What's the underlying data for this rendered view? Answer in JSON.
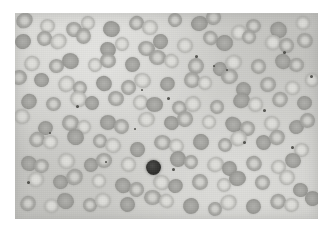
{
  "figure": {
    "kind": "photomicrograph",
    "modality": "light microscopy, Romanowsky-type stain rendered in grayscale",
    "canvas": {
      "width": 334,
      "height": 232,
      "page_background": "#ffffff"
    },
    "plate": {
      "left": 15,
      "top": 13,
      "width": 303,
      "height": 206,
      "background_color": "#d2d2ce",
      "border": "none"
    },
    "palette": {
      "page_white": "#ffffff",
      "field_light": "#d7d7d3",
      "field_mid": "#cdcdc9",
      "rbc_membrane": "#9e9e9a",
      "rbc_pallor": "#d6d6d2",
      "dark_cell": "#2e2e2c",
      "platelet": "#46464200"
    },
    "caption": "",
    "labels": [],
    "scale_bar": null,
    "annotations": []
  },
  "objects": {
    "dark_cell": {
      "name": "large dark nucleated cell",
      "cx": 131,
      "cy": 147,
      "d": 15
    },
    "erythrocytes": [
      {
        "x": 6,
        "y": 4,
        "w": 17,
        "h": 15,
        "k": ""
      },
      {
        "x": 26,
        "y": 2,
        "w": 15,
        "h": 14,
        "k": "pale"
      },
      {
        "x": 48,
        "y": 6,
        "w": 16,
        "h": 15,
        "k": ""
      },
      {
        "x": 70,
        "y": 1,
        "w": 14,
        "h": 14,
        "k": "pale"
      },
      {
        "x": 88,
        "y": 7,
        "w": 17,
        "h": 16,
        "k": "dense"
      },
      {
        "x": 110,
        "y": 3,
        "w": 15,
        "h": 14,
        "k": ""
      },
      {
        "x": 130,
        "y": 8,
        "w": 16,
        "h": 15,
        "k": "pale"
      },
      {
        "x": 152,
        "y": 2,
        "w": 14,
        "h": 14,
        "k": ""
      },
      {
        "x": 171,
        "y": 6,
        "w": 17,
        "h": 15,
        "k": "dense"
      },
      {
        "x": 193,
        "y": 1,
        "w": 15,
        "h": 15,
        "k": ""
      },
      {
        "x": 214,
        "y": 8,
        "w": 16,
        "h": 15,
        "k": "pale"
      },
      {
        "x": 236,
        "y": 3,
        "w": 15,
        "h": 14,
        "k": ""
      },
      {
        "x": 256,
        "y": 7,
        "w": 17,
        "h": 16,
        "k": "dense"
      },
      {
        "x": 278,
        "y": 2,
        "w": 14,
        "h": 14,
        "k": "pale"
      },
      {
        "x": 286,
        "y": 20,
        "w": 16,
        "h": 15,
        "k": ""
      },
      {
        "x": 0,
        "y": 22,
        "w": 16,
        "h": 15,
        "k": "dense"
      },
      {
        "x": 18,
        "y": 20,
        "w": 15,
        "h": 15,
        "k": ""
      },
      {
        "x": 38,
        "y": 24,
        "w": 17,
        "h": 15,
        "k": "pale"
      },
      {
        "x": 60,
        "y": 19,
        "w": 15,
        "h": 16,
        "k": ""
      },
      {
        "x": 80,
        "y": 25,
        "w": 16,
        "h": 15,
        "k": "dense"
      },
      {
        "x": 102,
        "y": 21,
        "w": 14,
        "h": 14,
        "k": "pale"
      },
      {
        "x": 121,
        "y": 26,
        "w": 17,
        "h": 15,
        "k": ""
      },
      {
        "x": 143,
        "y": 20,
        "w": 15,
        "h": 15,
        "k": "dense"
      },
      {
        "x": 163,
        "y": 25,
        "w": 16,
        "h": 15,
        "k": "pale"
      },
      {
        "x": 185,
        "y": 19,
        "w": 15,
        "h": 14,
        "k": ""
      },
      {
        "x": 205,
        "y": 24,
        "w": 17,
        "h": 16,
        "k": "dense"
      },
      {
        "x": 227,
        "y": 20,
        "w": 14,
        "h": 14,
        "k": ""
      },
      {
        "x": 246,
        "y": 26,
        "w": 16,
        "h": 15,
        "k": "pale"
      },
      {
        "x": 267,
        "y": 21,
        "w": 15,
        "h": 15,
        "k": ""
      },
      {
        "x": 8,
        "y": 40,
        "w": 16,
        "h": 15,
        "k": "pale"
      },
      {
        "x": 29,
        "y": 44,
        "w": 15,
        "h": 14,
        "k": ""
      },
      {
        "x": 49,
        "y": 39,
        "w": 17,
        "h": 16,
        "k": "dense"
      },
      {
        "x": 71,
        "y": 45,
        "w": 14,
        "h": 14,
        "k": "pale"
      },
      {
        "x": 90,
        "y": 41,
        "w": 16,
        "h": 15,
        "k": ""
      },
      {
        "x": 111,
        "y": 46,
        "w": 15,
        "h": 15,
        "k": "dense"
      },
      {
        "x": 131,
        "y": 40,
        "w": 17,
        "h": 15,
        "k": ""
      },
      {
        "x": 153,
        "y": 45,
        "w": 15,
        "h": 14,
        "k": "pale"
      },
      {
        "x": 173,
        "y": 41,
        "w": 16,
        "h": 16,
        "k": ""
      },
      {
        "x": 194,
        "y": 46,
        "w": 14,
        "h": 14,
        "k": "dense"
      },
      {
        "x": 213,
        "y": 40,
        "w": 17,
        "h": 15,
        "k": "pale"
      },
      {
        "x": 235,
        "y": 45,
        "w": 15,
        "h": 15,
        "k": ""
      },
      {
        "x": 255,
        "y": 41,
        "w": 16,
        "h": 15,
        "k": "dense"
      },
      {
        "x": 276,
        "y": 46,
        "w": 15,
        "h": 14,
        "k": ""
      },
      {
        "x": 288,
        "y": 62,
        "w": 14,
        "h": 14,
        "k": "pale"
      },
      {
        "x": 1,
        "y": 60,
        "w": 16,
        "h": 15,
        "k": ""
      },
      {
        "x": 20,
        "y": 64,
        "w": 15,
        "h": 14,
        "k": "dense"
      },
      {
        "x": 40,
        "y": 59,
        "w": 17,
        "h": 16,
        "k": "pale"
      },
      {
        "x": 62,
        "y": 65,
        "w": 14,
        "h": 14,
        "k": ""
      },
      {
        "x": 81,
        "y": 61,
        "w": 16,
        "h": 15,
        "k": "dense"
      },
      {
        "x": 102,
        "y": 66,
        "w": 15,
        "h": 15,
        "k": ""
      },
      {
        "x": 122,
        "y": 60,
        "w": 17,
        "h": 15,
        "k": "pale"
      },
      {
        "x": 144,
        "y": 65,
        "w": 15,
        "h": 14,
        "k": "dense"
      },
      {
        "x": 164,
        "y": 61,
        "w": 16,
        "h": 16,
        "k": ""
      },
      {
        "x": 185,
        "y": 66,
        "w": 14,
        "h": 14,
        "k": "pale"
      },
      {
        "x": 204,
        "y": 60,
        "w": 17,
        "h": 15,
        "k": ""
      },
      {
        "x": 226,
        "y": 65,
        "w": 15,
        "h": 15,
        "k": "dense"
      },
      {
        "x": 246,
        "y": 61,
        "w": 16,
        "h": 15,
        "k": ""
      },
      {
        "x": 267,
        "y": 66,
        "w": 15,
        "h": 14,
        "k": "pale"
      },
      {
        "x": 10,
        "y": 80,
        "w": 16,
        "h": 15,
        "k": "dense"
      },
      {
        "x": 31,
        "y": 84,
        "w": 15,
        "h": 14,
        "k": ""
      },
      {
        "x": 51,
        "y": 79,
        "w": 17,
        "h": 16,
        "k": "pale"
      },
      {
        "x": 73,
        "y": 85,
        "w": 14,
        "h": 14,
        "k": "dense"
      },
      {
        "x": 92,
        "y": 81,
        "w": 16,
        "h": 15,
        "k": ""
      },
      {
        "x": 113,
        "y": 86,
        "w": 15,
        "h": 15,
        "k": "pale"
      },
      {
        "x": 133,
        "y": 80,
        "w": 17,
        "h": 15,
        "k": "dense"
      },
      {
        "x": 155,
        "y": 85,
        "w": 15,
        "h": 14,
        "k": ""
      },
      {
        "x": 175,
        "y": 81,
        "w": 16,
        "h": 16,
        "k": "pale"
      },
      {
        "x": 196,
        "y": 86,
        "w": 14,
        "h": 14,
        "k": ""
      },
      {
        "x": 215,
        "y": 80,
        "w": 17,
        "h": 15,
        "k": "dense"
      },
      {
        "x": 237,
        "y": 85,
        "w": 15,
        "h": 15,
        "k": "pale"
      },
      {
        "x": 257,
        "y": 81,
        "w": 16,
        "h": 15,
        "k": ""
      },
      {
        "x": 278,
        "y": 86,
        "w": 15,
        "h": 14,
        "k": "dense"
      },
      {
        "x": 2,
        "y": 100,
        "w": 16,
        "h": 15,
        "k": "pale"
      },
      {
        "x": 22,
        "y": 104,
        "w": 15,
        "h": 14,
        "k": "dense"
      },
      {
        "x": 42,
        "y": 99,
        "w": 17,
        "h": 16,
        "k": ""
      },
      {
        "x": 64,
        "y": 105,
        "w": 14,
        "h": 14,
        "k": "pale"
      },
      {
        "x": 83,
        "y": 101,
        "w": 16,
        "h": 15,
        "k": "dense"
      },
      {
        "x": 104,
        "y": 106,
        "w": 15,
        "h": 15,
        "k": ""
      },
      {
        "x": 124,
        "y": 100,
        "w": 17,
        "h": 15,
        "k": "pale"
      },
      {
        "x": 146,
        "y": 105,
        "w": 15,
        "h": 14,
        "k": "dense"
      },
      {
        "x": 166,
        "y": 101,
        "w": 16,
        "h": 16,
        "k": ""
      },
      {
        "x": 187,
        "y": 106,
        "w": 14,
        "h": 14,
        "k": "pale"
      },
      {
        "x": 206,
        "y": 100,
        "w": 17,
        "h": 15,
        "k": "dense"
      },
      {
        "x": 228,
        "y": 105,
        "w": 15,
        "h": 15,
        "k": ""
      },
      {
        "x": 248,
        "y": 101,
        "w": 16,
        "h": 15,
        "k": "pale"
      },
      {
        "x": 269,
        "y": 106,
        "w": 15,
        "h": 14,
        "k": "dense"
      },
      {
        "x": 287,
        "y": 100,
        "w": 15,
        "h": 15,
        "k": ""
      },
      {
        "x": 12,
        "y": 120,
        "w": 16,
        "h": 15,
        "k": ""
      },
      {
        "x": 33,
        "y": 124,
        "w": 15,
        "h": 14,
        "k": "pale"
      },
      {
        "x": 53,
        "y": 119,
        "w": 17,
        "h": 16,
        "k": "dense"
      },
      {
        "x": 75,
        "y": 125,
        "w": 14,
        "h": 14,
        "k": ""
      },
      {
        "x": 94,
        "y": 121,
        "w": 16,
        "h": 15,
        "k": "pale"
      },
      {
        "x": 115,
        "y": 126,
        "w": 15,
        "h": 15,
        "k": "dense"
      },
      {
        "x": 135,
        "y": 120,
        "w": 17,
        "h": 15,
        "k": ""
      },
      {
        "x": 157,
        "y": 125,
        "w": 15,
        "h": 14,
        "k": "pale"
      },
      {
        "x": 177,
        "y": 121,
        "w": 16,
        "h": 16,
        "k": "dense"
      },
      {
        "x": 198,
        "y": 126,
        "w": 14,
        "h": 14,
        "k": ""
      },
      {
        "x": 217,
        "y": 120,
        "w": 17,
        "h": 15,
        "k": "pale"
      },
      {
        "x": 239,
        "y": 125,
        "w": 15,
        "h": 15,
        "k": "dense"
      },
      {
        "x": 259,
        "y": 121,
        "w": 16,
        "h": 15,
        "k": ""
      },
      {
        "x": 280,
        "y": 126,
        "w": 15,
        "h": 14,
        "k": "pale"
      },
      {
        "x": 3,
        "y": 140,
        "w": 16,
        "h": 15,
        "k": "dense"
      },
      {
        "x": 23,
        "y": 144,
        "w": 15,
        "h": 14,
        "k": ""
      },
      {
        "x": 43,
        "y": 139,
        "w": 17,
        "h": 16,
        "k": "pale"
      },
      {
        "x": 65,
        "y": 145,
        "w": 14,
        "h": 14,
        "k": "dense"
      },
      {
        "x": 84,
        "y": 141,
        "w": 16,
        "h": 15,
        "k": ""
      },
      {
        "x": 105,
        "y": 146,
        "w": 15,
        "h": 15,
        "k": "pale"
      },
      {
        "x": 150,
        "y": 141,
        "w": 16,
        "h": 16,
        "k": "dense"
      },
      {
        "x": 171,
        "y": 146,
        "w": 14,
        "h": 14,
        "k": ""
      },
      {
        "x": 190,
        "y": 140,
        "w": 17,
        "h": 15,
        "k": "pale"
      },
      {
        "x": 212,
        "y": 145,
        "w": 15,
        "h": 15,
        "k": "dense"
      },
      {
        "x": 232,
        "y": 141,
        "w": 16,
        "h": 15,
        "k": ""
      },
      {
        "x": 253,
        "y": 146,
        "w": 15,
        "h": 14,
        "k": "pale"
      },
      {
        "x": 274,
        "y": 140,
        "w": 16,
        "h": 15,
        "k": "dense"
      },
      {
        "x": 13,
        "y": 160,
        "w": 16,
        "h": 15,
        "k": "pale"
      },
      {
        "x": 34,
        "y": 164,
        "w": 15,
        "h": 14,
        "k": "dense"
      },
      {
        "x": 54,
        "y": 159,
        "w": 17,
        "h": 16,
        "k": ""
      },
      {
        "x": 76,
        "y": 165,
        "w": 14,
        "h": 14,
        "k": "pale"
      },
      {
        "x": 95,
        "y": 161,
        "w": 16,
        "h": 15,
        "k": "dense"
      },
      {
        "x": 116,
        "y": 166,
        "w": 15,
        "h": 15,
        "k": ""
      },
      {
        "x": 136,
        "y": 160,
        "w": 17,
        "h": 15,
        "k": "pale"
      },
      {
        "x": 158,
        "y": 165,
        "w": 15,
        "h": 14,
        "k": "dense"
      },
      {
        "x": 178,
        "y": 161,
        "w": 16,
        "h": 16,
        "k": ""
      },
      {
        "x": 199,
        "y": 166,
        "w": 14,
        "h": 14,
        "k": "pale"
      },
      {
        "x": 218,
        "y": 160,
        "w": 17,
        "h": 15,
        "k": "dense"
      },
      {
        "x": 240,
        "y": 165,
        "w": 15,
        "h": 15,
        "k": ""
      },
      {
        "x": 260,
        "y": 161,
        "w": 16,
        "h": 15,
        "k": "pale"
      },
      {
        "x": 281,
        "y": 166,
        "w": 15,
        "h": 14,
        "k": "dense"
      },
      {
        "x": 4,
        "y": 180,
        "w": 16,
        "h": 15,
        "k": ""
      },
      {
        "x": 24,
        "y": 184,
        "w": 15,
        "h": 14,
        "k": "pale"
      },
      {
        "x": 44,
        "y": 179,
        "w": 17,
        "h": 16,
        "k": "dense"
      },
      {
        "x": 66,
        "y": 185,
        "w": 14,
        "h": 14,
        "k": ""
      },
      {
        "x": 85,
        "y": 181,
        "w": 16,
        "h": 15,
        "k": "pale"
      },
      {
        "x": 106,
        "y": 186,
        "w": 15,
        "h": 15,
        "k": "dense"
      },
      {
        "x": 126,
        "y": 180,
        "w": 17,
        "h": 15,
        "k": ""
      },
      {
        "x": 148,
        "y": 185,
        "w": 15,
        "h": 14,
        "k": "pale"
      },
      {
        "x": 168,
        "y": 181,
        "w": 16,
        "h": 16,
        "k": "dense"
      },
      {
        "x": 189,
        "y": 186,
        "w": 14,
        "h": 14,
        "k": ""
      },
      {
        "x": 208,
        "y": 180,
        "w": 17,
        "h": 15,
        "k": "pale"
      },
      {
        "x": 230,
        "y": 185,
        "w": 15,
        "h": 15,
        "k": "dense"
      },
      {
        "x": 250,
        "y": 181,
        "w": 16,
        "h": 15,
        "k": ""
      },
      {
        "x": 271,
        "y": 186,
        "w": 15,
        "h": 14,
        "k": "pale"
      },
      {
        "x": 288,
        "y": 180,
        "w": 15,
        "h": 15,
        "k": "dense"
      }
    ],
    "platelets": [
      {
        "x": 180,
        "y": 42,
        "d": 3
      },
      {
        "x": 268,
        "y": 38,
        "d": 3
      },
      {
        "x": 211,
        "y": 56,
        "d": 2
      },
      {
        "x": 295,
        "y": 62,
        "d": 3
      },
      {
        "x": 61,
        "y": 92,
        "d": 3
      },
      {
        "x": 126,
        "y": 76,
        "d": 2
      },
      {
        "x": 152,
        "y": 84,
        "d": 3
      },
      {
        "x": 248,
        "y": 96,
        "d": 3
      },
      {
        "x": 119,
        "y": 115,
        "d": 2
      },
      {
        "x": 228,
        "y": 128,
        "d": 3
      },
      {
        "x": 276,
        "y": 133,
        "d": 3
      },
      {
        "x": 90,
        "y": 148,
        "d": 2
      },
      {
        "x": 157,
        "y": 155,
        "d": 3
      },
      {
        "x": 12,
        "y": 168,
        "d": 3
      },
      {
        "x": 198,
        "y": 52,
        "d": 2
      },
      {
        "x": 34,
        "y": 119,
        "d": 2
      }
    ]
  }
}
